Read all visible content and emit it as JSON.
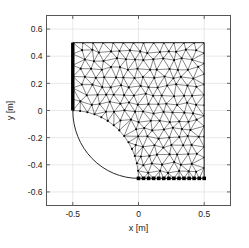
{
  "figure": {
    "background_color": "#ffffff",
    "axes_box_color": "#555555",
    "grid_color": "#e2e2e2",
    "mesh_edge_color": "#3c3c3c",
    "node_color": "#000000",
    "fixed_boundary_color": "#000000",
    "support_marker_color": "#000000"
  },
  "chart_data": {
    "type": "scatter",
    "title": "",
    "subtitle": "",
    "xlabel": "x [m]",
    "ylabel": "y [m]",
    "xlim": [
      -0.7,
      0.7
    ],
    "ylim": [
      -0.7,
      0.7
    ],
    "xticks": [
      -0.5,
      0,
      0.5
    ],
    "xticklabels": [
      "-0.5",
      "0",
      "0.5"
    ],
    "yticks": [
      0.6,
      0.4,
      0.2,
      0,
      -0.2,
      -0.4,
      -0.6
    ],
    "yticklabels": [
      "0.6",
      "0.4",
      "0.2",
      "0",
      "-0.2",
      "-0.4",
      "-0.6"
    ],
    "grid": true,
    "legend": null,
    "legend_position": "none",
    "annotations": [
      {
        "name": "fixed-boundary",
        "description": "thick vertical clamped edge at x = -0.5 from y = 0 to y = 0.5",
        "x": [
          -0.5,
          -0.5
        ],
        "y": [
          0.0,
          0.5
        ],
        "style": "thick-line"
      },
      {
        "name": "support-markers",
        "description": "filled square supports along bottom edge y = -0.5 from x = 0 to x = 0.5",
        "y": -0.5,
        "x": [
          0.0,
          0.038,
          0.077,
          0.115,
          0.154,
          0.192,
          0.231,
          0.269,
          0.308,
          0.346,
          0.385,
          0.423,
          0.462,
          0.5
        ],
        "style": "filled-square"
      }
    ],
    "domain": {
      "description": "Square plate x in [-0.5,0.5], y in [-0.5,0.5] with a quarter-circle notch of radius 0.5 centred at (-0.5,-0.5) removed from the lower-left corner",
      "outline": [
        [
          -0.5,
          0.5
        ],
        [
          0.5,
          0.5
        ],
        [
          0.5,
          -0.5
        ],
        [
          0.0,
          -0.5
        ]
      ],
      "arc": {
        "center": [
          -0.5,
          -0.5
        ],
        "radius": 0.5,
        "from": [
          0.0,
          -0.5
        ],
        "to": [
          -0.5,
          0.0
        ]
      }
    },
    "mesh": {
      "element_type": "triangle",
      "node_count": 186,
      "element_count": 318,
      "node_marker": "dot"
    }
  }
}
